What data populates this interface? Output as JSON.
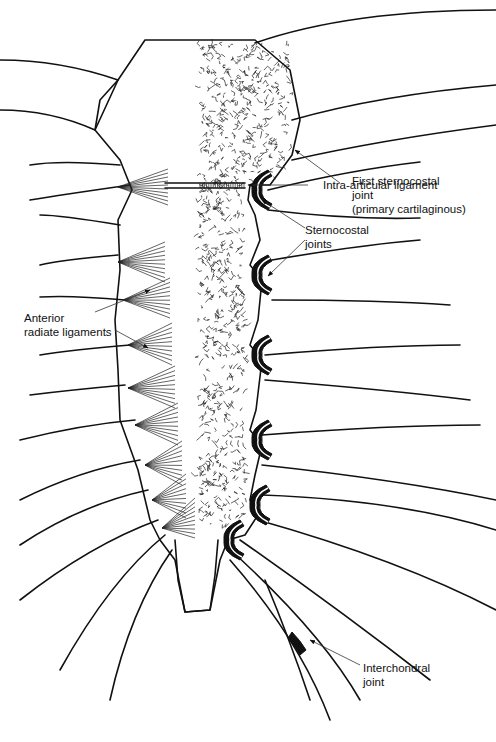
{
  "figure": {
    "colors": {
      "ink": "#111111",
      "background": "#ffffff"
    },
    "labels": {
      "first_sternocostal": [
        "First sternocostal",
        "joint",
        "(primary cartilaginous)"
      ],
      "intra_articular": [
        "Intra-articular ligament"
      ],
      "sternocostal_joints": [
        "Sternocostal",
        "joints"
      ],
      "anterior_radiate": [
        "Anterior",
        "radiate ligaments"
      ],
      "interchondral": [
        "Interchondral",
        "joint"
      ]
    }
  }
}
